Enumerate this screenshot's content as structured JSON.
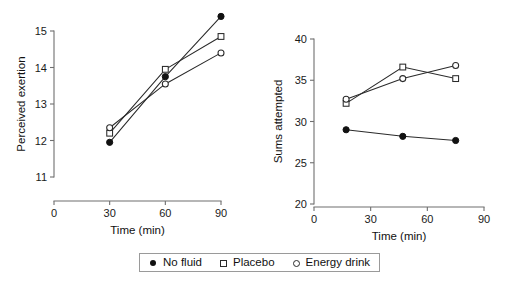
{
  "legend": {
    "items": [
      {
        "marker": "circle-filled",
        "label": "No fluid"
      },
      {
        "marker": "square-open",
        "label": "Placebo"
      },
      {
        "marker": "circle-open",
        "label": "Energy drink"
      }
    ]
  },
  "chart_data": [
    {
      "id": "perceived-exertion",
      "type": "line",
      "title": "",
      "xlabel": "Time (min)",
      "ylabel": "Perceived exertion",
      "xlim": [
        0,
        90
      ],
      "ylim": [
        11,
        15
      ],
      "xticks": [
        0,
        30,
        60,
        90
      ],
      "xtick_labels": [
        "0",
        "30",
        "60",
        "90"
      ],
      "yticks": [
        11,
        12,
        13,
        14,
        15
      ],
      "ytick_labels": [
        "11",
        "12",
        "13",
        "14",
        "15"
      ],
      "grid": false,
      "x": [
        30,
        60,
        90
      ],
      "series": [
        {
          "name": "No fluid",
          "marker": "circle-filled",
          "values": [
            11.95,
            13.75,
            15.4
          ]
        },
        {
          "name": "Placebo",
          "marker": "square-open",
          "values": [
            12.2,
            13.95,
            14.85
          ]
        },
        {
          "name": "Energy drink",
          "marker": "circle-open",
          "values": [
            12.35,
            13.55,
            14.4
          ]
        }
      ]
    },
    {
      "id": "sums-attempted",
      "type": "line",
      "title": "",
      "xlabel": "Time (min)",
      "ylabel": "Sums attempted",
      "xlim": [
        0,
        90
      ],
      "ylim": [
        20,
        40
      ],
      "xticks": [
        0,
        30,
        60,
        90
      ],
      "xtick_labels": [
        "0",
        "30",
        "60",
        "90"
      ],
      "yticks": [
        20,
        25,
        30,
        35,
        40
      ],
      "ytick_labels": [
        "20",
        "25",
        "30",
        "35",
        "40"
      ],
      "grid": false,
      "x": [
        17,
        47,
        75
      ],
      "series": [
        {
          "name": "No fluid",
          "marker": "circle-filled",
          "values": [
            29.0,
            28.2,
            27.7
          ]
        },
        {
          "name": "Placebo",
          "marker": "square-open",
          "values": [
            32.2,
            36.6,
            35.2
          ]
        },
        {
          "name": "Energy drink",
          "marker": "circle-open",
          "values": [
            32.7,
            35.2,
            36.8
          ]
        }
      ]
    }
  ]
}
